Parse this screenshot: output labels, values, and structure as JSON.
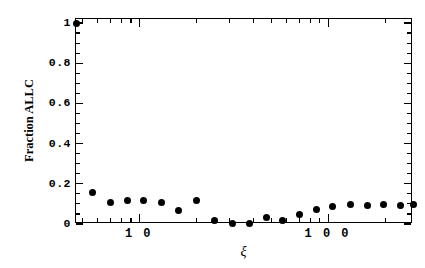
{
  "chart_data": {
    "type": "scatter",
    "title": "",
    "xlabel": "ξ",
    "ylabel": "Fraction ALLC",
    "xscale": "log",
    "yscale": "linear",
    "xlim": [
      4.6,
      280
    ],
    "ylim": [
      0,
      1.02
    ],
    "grid": false,
    "legend": null,
    "marker": "filled-circle",
    "marker_color": "#000000",
    "series": [
      {
        "name": "Fraction ALLC",
        "x": [
          4.6,
          5.6,
          7.0,
          8.6,
          10.5,
          13.0,
          16.0,
          20.0,
          25.0,
          31.0,
          38.0,
          47.0,
          57.0,
          70.0,
          86.0,
          105.0,
          130.0,
          160.0,
          196.0,
          240.0,
          280.0
        ],
        "values": [
          1.0,
          0.155,
          0.105,
          0.115,
          0.115,
          0.105,
          0.065,
          0.115,
          0.015,
          0.002,
          0.003,
          0.03,
          0.018,
          0.047,
          0.07,
          0.088,
          0.098,
          0.092,
          0.098,
          0.092,
          0.098
        ]
      }
    ],
    "ytick_labels": [
      "0",
      "0.2",
      "0.4",
      "0.6",
      "0.8",
      "1"
    ],
    "ytick_values": [
      0,
      0.2,
      0.4,
      0.6,
      0.8,
      1
    ],
    "xtick_labels": [
      "1 0",
      "1 0 0"
    ],
    "xtick_values": [
      10,
      100
    ]
  }
}
